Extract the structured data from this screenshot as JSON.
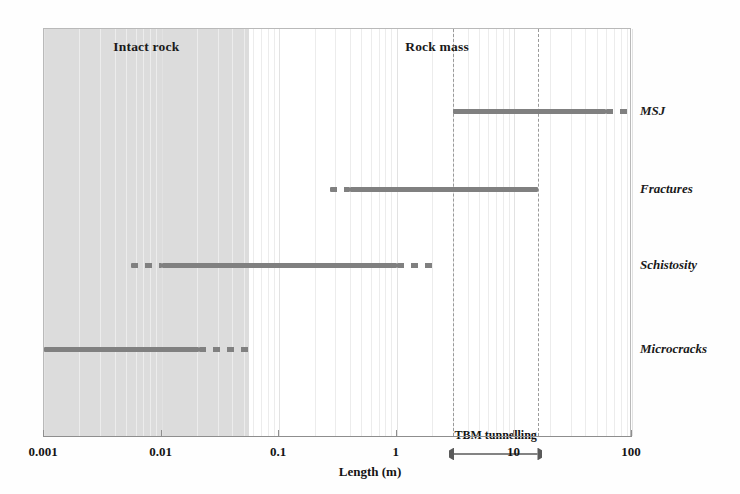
{
  "chart_data": {
    "type": "bar",
    "title": "",
    "xlabel": "Length (m)",
    "ylabel": "",
    "xscale": "log",
    "xlim": [
      0.001,
      100
    ],
    "xticks": [
      0.001,
      0.01,
      0.1,
      1,
      10,
      100
    ],
    "xticklabels": [
      "0.001",
      "0.01",
      "0.1",
      "1",
      "10",
      "100"
    ],
    "grid": true,
    "legend": "none",
    "categories": [
      "MSJ",
      "Fractures",
      "Schistosity",
      "Microcracks"
    ],
    "series": [
      {
        "name": "MSJ",
        "label": "MSJ",
        "solid_range": [
          3.0,
          60.0
        ],
        "dashed_right_range": [
          60.0,
          100.0
        ],
        "dashed_left_range": null
      },
      {
        "name": "Fractures",
        "label": "Fractures",
        "solid_range": [
          0.4,
          16.0
        ],
        "dashed_right_range": null,
        "dashed_left_range": [
          0.27,
          0.4
        ]
      },
      {
        "name": "Schistosity",
        "label": "Schistosity",
        "solid_range": [
          0.01,
          1.0
        ],
        "dashed_right_range": [
          1.0,
          2.2
        ],
        "dashed_left_range": [
          0.0055,
          0.01
        ]
      },
      {
        "name": "Microcracks",
        "label": "Microcracks",
        "solid_range": [
          0.001,
          0.021
        ],
        "dashed_right_range": [
          0.021,
          0.055
        ],
        "dashed_left_range": null
      }
    ],
    "regions": [
      {
        "name": "intact-rock",
        "label": "Intact rock",
        "range": [
          0.001,
          0.055
        ],
        "shaded": true,
        "color": "#dcdcdc"
      },
      {
        "name": "rock-mass",
        "label": "Rock mass",
        "range": [
          0.055,
          100
        ],
        "shaded": false,
        "color": "#ffffff"
      }
    ],
    "annotations": [
      {
        "name": "tbm-tunnelling",
        "label": "TBM tunnelling",
        "range": [
          3.0,
          16.0
        ],
        "style": "double-headed-arrow"
      }
    ],
    "colors": {
      "bar": "#808080",
      "shaded_band": "#dcdcdc",
      "axis": "#8e8e8e",
      "gridline": "#ececec",
      "dashed_gridline": "#9a9a9a",
      "text": "#141414",
      "background": "#ffffff"
    }
  },
  "axis": {
    "title": "Length (m)",
    "ticks": [
      {
        "value": "0.001",
        "x": 43
      },
      {
        "value": "0.01",
        "x": 160.6
      },
      {
        "value": "0.1",
        "x": 278.2
      },
      {
        "value": "1",
        "x": 395.8
      },
      {
        "value": "10",
        "x": 513.4
      },
      {
        "value": "100",
        "x": 631
      }
    ]
  },
  "regions": {
    "intact": {
      "label": "Intact rock"
    },
    "rockmass": {
      "label": "Rock mass"
    }
  },
  "labels": {
    "msj": "MSJ",
    "fractures": "Fractures",
    "schistosity": "Schistosity",
    "microcracks": "Microcracks"
  },
  "annotation": {
    "tbm": "TBM tunnelling"
  }
}
